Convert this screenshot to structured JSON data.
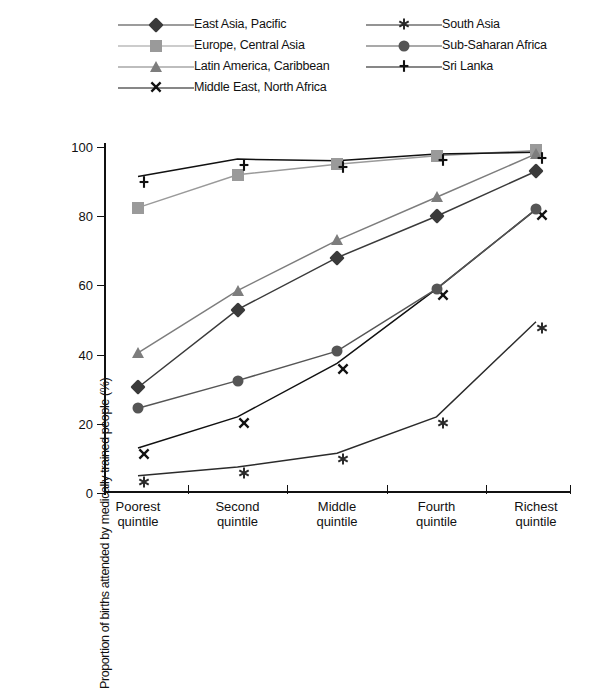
{
  "chart_data": {
    "type": "line",
    "title": "",
    "xlabel": "",
    "ylabel": "Proportion of births attended by medically trained people (%)",
    "ylim": [
      0,
      100
    ],
    "yticks": [
      0,
      20,
      40,
      60,
      80,
      100
    ],
    "grid": false,
    "legend_position": "top",
    "categories": [
      "Poorest quintile",
      "Second quintile",
      "Middle quintile",
      "Fourth quintile",
      "Richest quintile"
    ],
    "series": [
      {
        "name": "East Asia, Pacific",
        "marker": "diamond",
        "color": "#3a3a3a",
        "values": [
          30.5,
          53,
          68,
          80,
          93
        ]
      },
      {
        "name": "Europe, Central Asia",
        "marker": "square",
        "color": "#9a9a9a",
        "values": [
          82.5,
          92,
          95,
          97.5,
          99
        ]
      },
      {
        "name": "Latin America, Caribbean",
        "marker": "triangle",
        "color": "#7d7d7d",
        "values": [
          40.5,
          58.5,
          73,
          85.5,
          98
        ]
      },
      {
        "name": "Middle East, North Africa",
        "marker": "x",
        "color": "#111111",
        "values": [
          13,
          22,
          37.5,
          59,
          82
        ]
      },
      {
        "name": "South Asia",
        "marker": "star",
        "color": "#2b2b2b",
        "values": [
          5,
          7.5,
          11.5,
          22,
          49.5
        ]
      },
      {
        "name": "Sub-Saharan Africa",
        "marker": "circle",
        "color": "#555555",
        "values": [
          24.5,
          32.5,
          41,
          59,
          82
        ]
      },
      {
        "name": "Sri Lanka",
        "marker": "plus",
        "color": "#111111",
        "values": [
          91.5,
          96.5,
          96,
          98,
          98.5
        ]
      }
    ]
  },
  "legend": {
    "columns": [
      [
        "East Asia, Pacific",
        "Europe, Central Asia",
        "Latin America, Caribbean",
        "Middle East, North Africa"
      ],
      [
        "South Asia",
        "Sub-Saharan Africa",
        "Sri Lanka"
      ]
    ]
  }
}
